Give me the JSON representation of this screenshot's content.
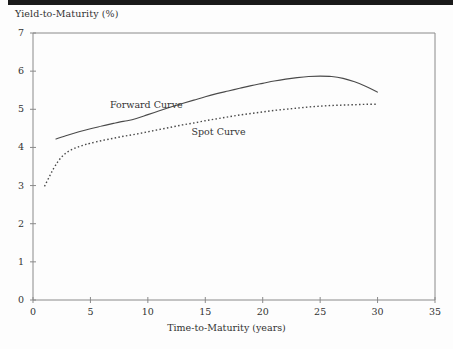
{
  "figure": {
    "top_rule_color": "#1a1a1a",
    "background_color": "#fdfdfd",
    "axis_color": "#8a8a8a",
    "curve_color": "#4a4a4a"
  },
  "chart_data": {
    "type": "line",
    "title": "",
    "xlabel": "Time-to-Maturity (years)",
    "ylabel": "Yield-to-Maturity (%)",
    "xlim": [
      0,
      35
    ],
    "ylim": [
      0,
      7
    ],
    "xticks": [
      "0",
      "5",
      "10",
      "15",
      "20",
      "25",
      "30",
      "35"
    ],
    "yticks": [
      "0",
      "1",
      "2",
      "3",
      "4",
      "5",
      "6",
      "7"
    ],
    "grid": false,
    "legend_position": "inline-annotations",
    "annotations": [
      {
        "text": "Forward Curve",
        "x": 6.7,
        "y": 5.12
      },
      {
        "text": "Spot Curve",
        "x": 13.8,
        "y": 4.4
      }
    ],
    "series": [
      {
        "name": "Forward Curve",
        "style": "solid",
        "x": [
          2.0,
          3.0,
          4.0,
          5.0,
          6.0,
          7.0,
          7.6,
          8.2,
          9.0,
          10.0,
          11.0,
          12.0,
          13.0,
          14.0,
          15.0,
          16.0,
          17.0,
          18.0,
          19.0,
          20.0,
          21.0,
          22.0,
          23.0,
          24.0,
          25.0,
          26.0,
          27.0,
          28.0,
          29.0,
          30.0
        ],
        "y": [
          4.22,
          4.32,
          4.41,
          4.49,
          4.56,
          4.63,
          4.67,
          4.7,
          4.76,
          4.86,
          4.96,
          5.06,
          5.15,
          5.24,
          5.33,
          5.41,
          5.48,
          5.55,
          5.62,
          5.68,
          5.74,
          5.79,
          5.83,
          5.86,
          5.87,
          5.86,
          5.81,
          5.72,
          5.6,
          5.45
        ]
      },
      {
        "name": "Spot Curve",
        "style": "dotted",
        "x": [
          1.0,
          1.4,
          1.8,
          2.2,
          2.6,
          3.0,
          3.5,
          4.0,
          4.5,
          5.0,
          6.0,
          7.0,
          8.0,
          9.0,
          10.0,
          11.0,
          12.0,
          13.0,
          14.0,
          15.0,
          16.0,
          17.0,
          18.0,
          19.0,
          20.0,
          21.0,
          22.0,
          23.0,
          24.0,
          25.0,
          26.0,
          27.0,
          28.0,
          29.0,
          30.0
        ],
        "y": [
          2.98,
          3.22,
          3.45,
          3.64,
          3.78,
          3.88,
          3.96,
          4.02,
          4.07,
          4.11,
          4.18,
          4.24,
          4.3,
          4.35,
          4.41,
          4.47,
          4.53,
          4.59,
          4.64,
          4.7,
          4.75,
          4.8,
          4.85,
          4.89,
          4.93,
          4.97,
          5.0,
          5.03,
          5.06,
          5.08,
          5.1,
          5.11,
          5.12,
          5.13,
          5.13
        ]
      }
    ]
  }
}
